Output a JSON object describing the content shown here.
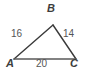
{
  "figure": {
    "type": "triangle-diagram",
    "stroke_color": "#3a3a3a",
    "text_color": "#4a4a4a",
    "background_color": "#ffffff",
    "vertices": [
      {
        "name": "vertex-a",
        "label": "A",
        "x": 14,
        "y": 59
      },
      {
        "name": "vertex-b",
        "label": "B",
        "x": 53,
        "y": 25
      },
      {
        "name": "vertex-c",
        "label": "C",
        "x": 76,
        "y": 59
      }
    ],
    "sides": [
      {
        "name": "side-ab",
        "label": "16",
        "from": "A",
        "to": "B"
      },
      {
        "name": "side-bc",
        "label": "14",
        "from": "B",
        "to": "C"
      },
      {
        "name": "side-ac",
        "label": "20",
        "from": "A",
        "to": "C"
      }
    ]
  }
}
